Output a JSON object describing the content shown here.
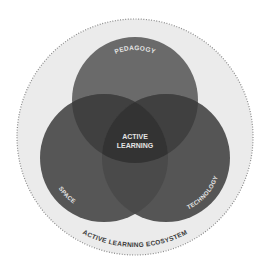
{
  "diagram": {
    "type": "venn",
    "outer": {
      "label": "ACTIVE LEARNING ECOSYSTEM",
      "fill": "#ebebeb",
      "border": "#8a8a8a"
    },
    "circles": [
      {
        "id": "pedagogy",
        "label": "PEDAGOGY",
        "fill": "#6a6a6a"
      },
      {
        "id": "space",
        "label": "SPACE",
        "fill": "#555555"
      },
      {
        "id": "technology",
        "label": "TECHNOLOGY",
        "fill": "#555555"
      }
    ],
    "center": {
      "line1": "ACTIVE",
      "line2": "LEARNING",
      "fill": "#333333"
    },
    "overlap_color": "#3c3c3c"
  }
}
